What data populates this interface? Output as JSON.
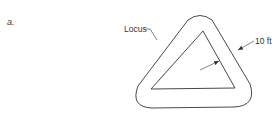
{
  "figure": {
    "label": "a."
  },
  "diagram": {
    "locus_label": "Locus",
    "distance_label": "10 ft",
    "stroke_color": "#333333",
    "background_color": "#ffffff",
    "inner_triangle": {
      "apex": [
        203,
        31
      ],
      "bottom_left": [
        151,
        89
      ],
      "bottom_right": [
        235,
        88
      ]
    },
    "offset_distance": "10 ft"
  }
}
